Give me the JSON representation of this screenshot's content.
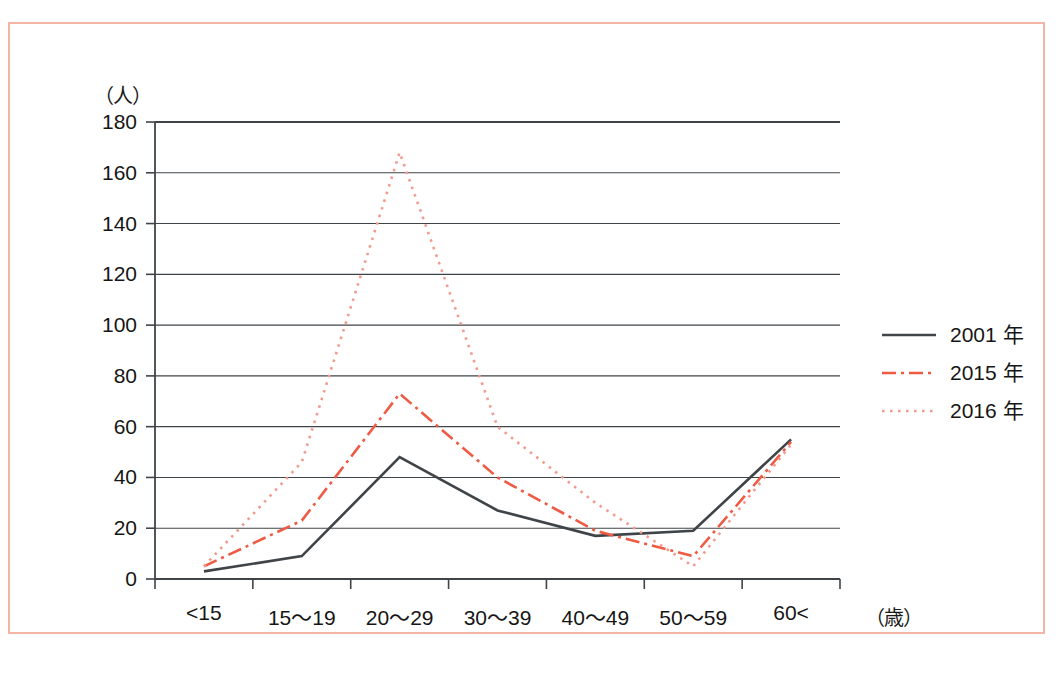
{
  "chart_data": {
    "type": "line",
    "title": "",
    "subtitle": "",
    "xlabel": "（歳）",
    "ylabel": "（人）",
    "categories": [
      "<15",
      "15〜19",
      "20〜29",
      "30〜39",
      "40〜49",
      "50〜59",
      "60<"
    ],
    "ylim": [
      0,
      180
    ],
    "ytick_values": [
      0,
      20,
      40,
      60,
      80,
      100,
      120,
      140,
      160,
      180
    ],
    "ytick_labels": [
      "0",
      "20",
      "40",
      "60",
      "80",
      "100",
      "120",
      "140",
      "160",
      "180"
    ],
    "grid": "horizontal",
    "legend_position": "right",
    "series": [
      {
        "name": "2001 年",
        "values": [
          3,
          9,
          48,
          27,
          17,
          19,
          55
        ],
        "color": "#3f4448",
        "style": "solid"
      },
      {
        "name": "2015 年",
        "values": [
          5,
          23,
          73,
          40,
          19,
          9,
          54
        ],
        "color": "#ee5a44",
        "style": "dash-dot"
      },
      {
        "name": "2016 年",
        "values": [
          5,
          46,
          168,
          60,
          30,
          5,
          53
        ],
        "color": "#f29a8d",
        "style": "dotted"
      }
    ]
  },
  "legend": {
    "items": [
      {
        "label": "2001 年"
      },
      {
        "label": "2015 年"
      },
      {
        "label": "2016 年"
      }
    ]
  },
  "axes": {
    "y_unit": "（人）",
    "x_unit": "（歳）"
  },
  "colors": {
    "frame": "#f2b5a6",
    "axis": "#3f4448",
    "grid": "#3f4448",
    "series_2001": "#3f4448",
    "series_2015": "#ee5a44",
    "series_2016": "#f29a8d"
  }
}
